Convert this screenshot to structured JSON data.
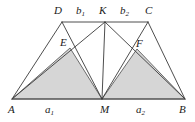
{
  "figure": {
    "canvas": {
      "width": 195,
      "height": 122
    },
    "colors": {
      "stroke": "#3a3a3a",
      "shade_fill": "#d6d6d6",
      "shade_stroke": "#6b6b6b",
      "background": "#ffffff",
      "label": "#1a1a1a"
    },
    "points": {
      "A": {
        "x": 12,
        "y": 99,
        "label": "A"
      },
      "B": {
        "x": 185,
        "y": 99,
        "label": "B"
      },
      "C": {
        "x": 148,
        "y": 22,
        "label": "C"
      },
      "D": {
        "x": 62,
        "y": 22,
        "label": "D"
      },
      "K": {
        "x": 105,
        "y": 22,
        "label": "K"
      },
      "M": {
        "x": 102,
        "y": 99,
        "label": "M"
      },
      "E": {
        "x": 70,
        "y": 48,
        "label": "E"
      },
      "F": {
        "x": 137,
        "y": 49,
        "label": "F"
      }
    },
    "segment_labels": {
      "a1": {
        "base": "a",
        "sub": "1"
      },
      "a2": {
        "base": "a",
        "sub": "2"
      },
      "b1": {
        "base": "b",
        "sub": "1"
      },
      "b2": {
        "base": "b",
        "sub": "2"
      }
    },
    "edges": [
      "A-D",
      "D-C",
      "C-B",
      "A-B",
      "D-M",
      "A-K",
      "K-M",
      "K-B",
      "C-M"
    ],
    "shaded_triangles": [
      "A-E-M",
      "M-F-B"
    ]
  }
}
